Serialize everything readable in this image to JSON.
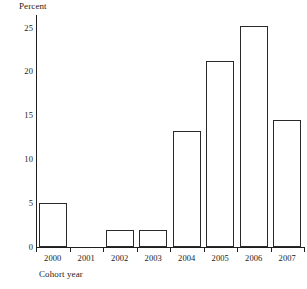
{
  "chart_data": {
    "type": "bar",
    "title": "",
    "subtitle": "",
    "xlabel": "Cohort year",
    "ylabel": "Percent",
    "categories": [
      "2000",
      "2001",
      "2002",
      "2003",
      "2004",
      "2005",
      "2006",
      "2007"
    ],
    "values": [
      5.0,
      0,
      2.0,
      2.0,
      13.2,
      21.3,
      25.3,
      14.5
    ],
    "ylim": [
      0,
      26.5
    ],
    "yticks": [
      0,
      5,
      10,
      15,
      20,
      25
    ],
    "ytick_labels": [
      "0",
      "5",
      "10",
      "15",
      "20",
      "25"
    ],
    "grid": false,
    "legend": null,
    "bar_style": {
      "fill": "#ffffff",
      "stroke": "#2a2a2a"
    },
    "axis_color": "#1f1f1f"
  },
  "axes": {
    "y_title": "Percent",
    "x_title": "Cohort year"
  }
}
